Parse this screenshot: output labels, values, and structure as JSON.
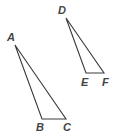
{
  "diagram": {
    "type": "geometry",
    "stroke_color": "#3a3a3a",
    "label_color": "#444444",
    "triangles": [
      {
        "name": "triangle-ABC",
        "vertices": [
          "A",
          "B",
          "C"
        ],
        "labels": {
          "A": "A",
          "B": "B",
          "C": "C"
        }
      },
      {
        "name": "triangle-DEF",
        "vertices": [
          "D",
          "E",
          "F"
        ],
        "labels": {
          "D": "D",
          "E": "E",
          "F": "F"
        }
      }
    ]
  }
}
